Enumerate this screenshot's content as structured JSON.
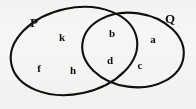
{
  "figure": {
    "kind": "venn-diagram",
    "background_color": "#f7f6f4",
    "stroke_color": "#100f0d",
    "text_color": "#100f0d",
    "width": 196,
    "height": 109
  },
  "sets": [
    {
      "id": "P",
      "label": "P",
      "label_x": 34,
      "label_y": 22,
      "ellipse": {
        "cx": 74,
        "cy": 51,
        "rx": 64,
        "ry": 43,
        "rotate": -12
      }
    },
    {
      "id": "Q",
      "label": "Q",
      "label_x": 170,
      "label_y": 18,
      "ellipse": {
        "cx": 133,
        "cy": 50,
        "rx": 51,
        "ry": 37,
        "rotate": 8
      }
    }
  ],
  "elements": [
    {
      "label": "k",
      "region": "P-only",
      "x": 62,
      "y": 37
    },
    {
      "label": "f",
      "region": "P-only",
      "x": 39,
      "y": 68
    },
    {
      "label": "h",
      "region": "P-only",
      "x": 73,
      "y": 70
    },
    {
      "label": "b",
      "region": "P-and-Q",
      "x": 112,
      "y": 33
    },
    {
      "label": "d",
      "region": "P-and-Q",
      "x": 110,
      "y": 60
    },
    {
      "label": "a",
      "region": "Q-only",
      "x": 153,
      "y": 39
    },
    {
      "label": "c",
      "region": "Q-only",
      "x": 140,
      "y": 65
    }
  ]
}
